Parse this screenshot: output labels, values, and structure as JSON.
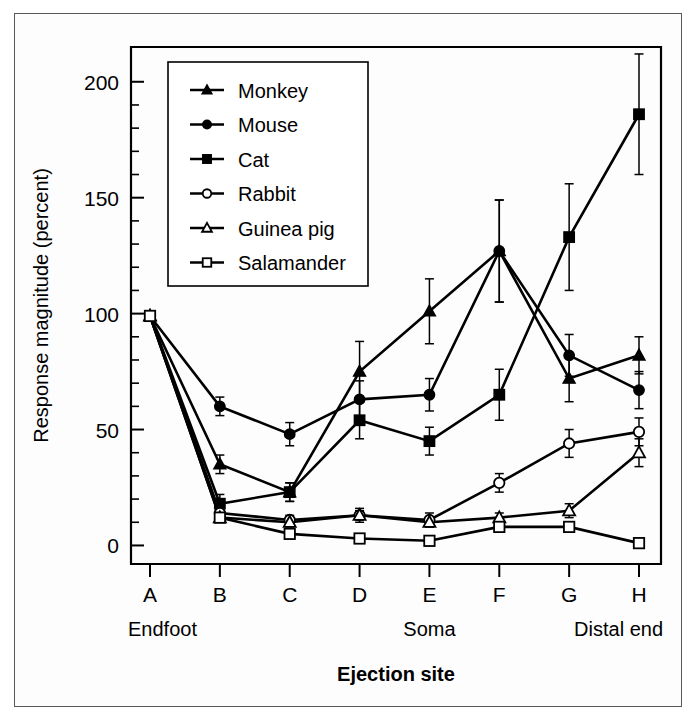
{
  "chart_data": {
    "type": "line",
    "title": "",
    "xlabel": "Ejection site",
    "ylabel": "Response magnitude (percent)",
    "categories": [
      "A",
      "B",
      "C",
      "D",
      "E",
      "F",
      "G",
      "H"
    ],
    "xlim": [
      0,
      9
    ],
    "ylim": [
      -8,
      215
    ],
    "yticks": [
      0,
      50,
      100,
      150,
      200
    ],
    "ytick_labels": [
      "0",
      "50",
      "100",
      "150",
      "200"
    ],
    "y_minor_step": 10,
    "grid": false,
    "legend_position": "upper-left-inside",
    "annotations": [
      {
        "text": "Endfoot",
        "at_category": "A"
      },
      {
        "text": "Soma",
        "at_category": "E"
      },
      {
        "text": "Distal end",
        "at_category": "H"
      }
    ],
    "series": [
      {
        "name": "Monkey",
        "marker": "filled-triangle",
        "values": [
          99,
          35,
          23,
          75,
          101,
          127,
          72,
          82
        ],
        "errors": [
          1,
          4,
          4,
          13,
          14,
          22,
          10,
          8
        ]
      },
      {
        "name": "Mouse",
        "marker": "filled-circle",
        "values": [
          99,
          60,
          48,
          63,
          65,
          127,
          82,
          67
        ],
        "errors": [
          1,
          4,
          5,
          8,
          7,
          22,
          9,
          8
        ]
      },
      {
        "name": "Cat",
        "marker": "filled-square",
        "values": [
          99,
          18,
          23,
          54,
          45,
          65,
          133,
          186
        ],
        "errors": [
          1,
          4,
          4,
          8,
          6,
          11,
          23,
          26
        ]
      },
      {
        "name": "Rabbit",
        "marker": "open-circle",
        "values": [
          99,
          14,
          11,
          13,
          11,
          27,
          44,
          49
        ],
        "errors": [
          1,
          2,
          2,
          3,
          3,
          4,
          6,
          6
        ]
      },
      {
        "name": "Guinea pig",
        "marker": "open-triangle",
        "values": [
          99,
          12,
          10,
          13,
          10,
          12,
          15,
          40
        ],
        "errors": [
          1,
          2,
          2,
          2,
          2,
          2,
          3,
          6
        ]
      },
      {
        "name": "Salamander",
        "marker": "open-square",
        "values": [
          99,
          12,
          5,
          3,
          2,
          8,
          8,
          1
        ],
        "errors": [
          1,
          2,
          1,
          1,
          1,
          1,
          1,
          1
        ]
      }
    ]
  }
}
